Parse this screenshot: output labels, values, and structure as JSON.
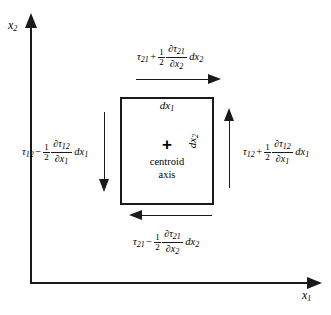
{
  "figure": {
    "background_color": "#ffffff",
    "line_color": "#1a1a1a"
  },
  "axes": {
    "vertical": {
      "label_base": "x",
      "label_sub": "2",
      "icon": "arrow-up-icon",
      "direction": "up"
    },
    "horizontal": {
      "label_base": "x",
      "label_sub": "1",
      "icon": "arrow-right-icon",
      "direction": "right"
    }
  },
  "element": {
    "width_label": {
      "base": "dx",
      "sub": "1"
    },
    "height_label": {
      "base": "dx",
      "sub": "2"
    },
    "centroid_marker": "+",
    "centroid_text_line1": "centroid",
    "centroid_text_line2": "axis"
  },
  "stress_labels": {
    "top": {
      "symbol": "τ",
      "symbol_sub": "21",
      "operator": "+",
      "coefficient_num": "1",
      "coefficient_den": "2",
      "partial_num": "∂τ",
      "partial_num_sub": "21",
      "partial_den": "∂x",
      "partial_den_sub": "2",
      "differential": "dx",
      "differential_sub": "2",
      "arrow_direction": "right",
      "arrow_icon": "arrow-right-icon"
    },
    "bottom": {
      "symbol": "τ",
      "symbol_sub": "21",
      "operator": "−",
      "coefficient_num": "1",
      "coefficient_den": "2",
      "partial_num": "∂τ",
      "partial_num_sub": "21",
      "partial_den": "∂x",
      "partial_den_sub": "2",
      "differential": "dx",
      "differential_sub": "2",
      "arrow_direction": "left",
      "arrow_icon": "arrow-left-icon"
    },
    "left": {
      "symbol": "τ",
      "symbol_sub": "12",
      "operator": "−",
      "coefficient_num": "1",
      "coefficient_den": "2",
      "partial_num": "∂τ",
      "partial_num_sub": "12",
      "partial_den": "∂x",
      "partial_den_sub": "1",
      "differential": "dx",
      "differential_sub": "1",
      "arrow_direction": "down",
      "arrow_icon": "arrow-down-icon"
    },
    "right": {
      "symbol": "τ",
      "symbol_sub": "12",
      "operator": "+",
      "coefficient_num": "1",
      "coefficient_den": "2",
      "partial_num": "∂τ",
      "partial_num_sub": "12",
      "partial_den": "∂x",
      "partial_den_sub": "1",
      "differential": "dx",
      "differential_sub": "1",
      "arrow_direction": "up",
      "arrow_icon": "arrow-up-icon"
    }
  }
}
